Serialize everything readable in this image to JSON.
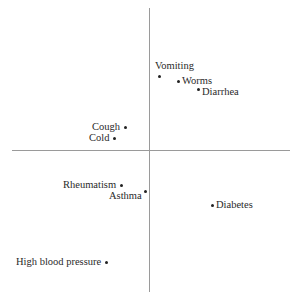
{
  "chart_data": {
    "type": "scatter",
    "title": "",
    "xlabel": "",
    "ylabel": "",
    "grid": false,
    "legend": null,
    "axes": "crosshair through origin, no ticks",
    "xlim": [
      -1.37,
      1.41
    ],
    "ylim": [
      -1.42,
      1.42
    ],
    "points": [
      {
        "label": "Vomiting",
        "x": 0.1,
        "y": 0.74,
        "label_pos": "above"
      },
      {
        "label": "Worms",
        "x": 0.29,
        "y": 0.69,
        "label_pos": "right"
      },
      {
        "label": "Diarrhea",
        "x": 0.49,
        "y": 0.61,
        "label_pos": "right-below"
      },
      {
        "label": "Cough",
        "x": -0.24,
        "y": 0.23,
        "label_pos": "left"
      },
      {
        "label": "Cold",
        "x": -0.35,
        "y": 0.12,
        "label_pos": "left"
      },
      {
        "label": "Rheumatism",
        "x": -0.28,
        "y": -0.35,
        "label_pos": "left"
      },
      {
        "label": "Asthma",
        "x": -0.04,
        "y": -0.41,
        "label_pos": "left-below"
      },
      {
        "label": "Diabetes",
        "x": 0.63,
        "y": -0.55,
        "label_pos": "right"
      },
      {
        "label": "High blood pressure",
        "x": -0.43,
        "y": -1.12,
        "label_pos": "left"
      }
    ]
  }
}
